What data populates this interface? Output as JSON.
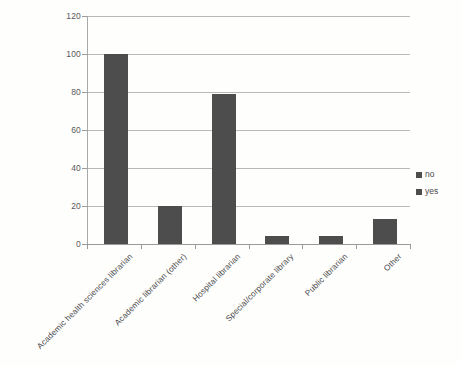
{
  "chart_data": {
    "type": "bar",
    "title": "",
    "subtitle": "",
    "xlabel": "",
    "ylabel": "",
    "categories": [
      "Academic health sciences librarian",
      "Academic librarian (other)",
      "Hospital librarian",
      "Special/corporate library",
      "Public librarian",
      "Other"
    ],
    "series": [
      {
        "name": "yes",
        "values": [
          100,
          20,
          79,
          4,
          4,
          13
        ],
        "color": "#4d4d4d"
      }
    ],
    "legend": {
      "position": "right",
      "entries": [
        {
          "label": "no",
          "color": "#4d4d4d"
        },
        {
          "label": "yes",
          "color": "#4d4d4d"
        }
      ]
    },
    "ylim": [
      0,
      120
    ],
    "yticks": [
      0,
      20,
      40,
      60,
      80,
      100,
      120
    ],
    "ytick_labels": [
      "0",
      "20",
      "40",
      "60",
      "80",
      "100",
      "120"
    ],
    "grid": "horizontal",
    "xtick_label_rotation": -45
  }
}
